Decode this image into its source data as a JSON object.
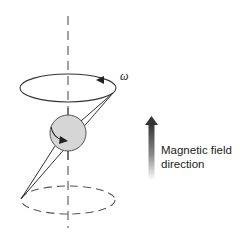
{
  "diagram": {
    "angular_velocity_label": "ω",
    "field_label_line1": "Magnetic field",
    "field_label_line2": "direction"
  },
  "colors": {
    "stroke": "#333333",
    "sphere_fill": "#d6d6d6",
    "sphere_stroke": "#555555",
    "axis": "#555555",
    "arrow_dark": "#333333",
    "arrow_light": "#ffffff"
  },
  "elements": [
    {
      "name": "rotation-axis",
      "type": "dashed-line"
    },
    {
      "name": "upper-precession-orbit",
      "type": "solid-ellipse"
    },
    {
      "name": "lower-precession-orbit",
      "type": "dashed-ellipse"
    },
    {
      "name": "spinning-particle",
      "type": "sphere"
    },
    {
      "name": "spin-axis",
      "type": "line"
    },
    {
      "name": "magnetic-field-arrow",
      "type": "gradient-arrow"
    }
  ]
}
